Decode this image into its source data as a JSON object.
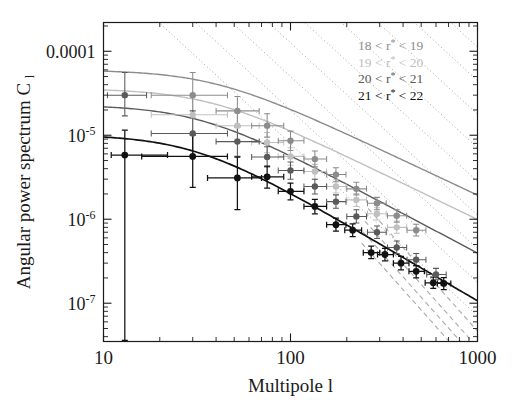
{
  "chart_data": {
    "type": "scatter",
    "title": "",
    "subtitle": "",
    "xlabel": "Multipole l",
    "ylabel": "Angular power spectrum C_l",
    "ylabel_base": "Angular power spectrum C",
    "ylabel_sub": "l",
    "xscale": "log",
    "yscale": "log",
    "xlim": [
      10,
      1000
    ],
    "ylim": [
      3.5e-08,
      0.00022
    ],
    "grid": false,
    "legend_position": "top-right",
    "xticks": [
      10,
      100,
      1000
    ],
    "xtick_labels": [
      "10",
      "100",
      "1000"
    ],
    "yticks": [
      0.0001,
      1e-05,
      1e-06,
      1e-07
    ],
    "ytick_labels": [
      "0.0001",
      "10⁻⁵",
      "10⁻⁶",
      "10⁻⁷"
    ],
    "ytick_label_parts": [
      {
        "mantissa": "0.0001",
        "exponent": ""
      },
      {
        "mantissa": "10",
        "exponent": "-5"
      },
      {
        "mantissa": "10",
        "exponent": "-6"
      },
      {
        "mantissa": "10",
        "exponent": "-7"
      }
    ],
    "annotations": [
      "dotted diagonal reference lines of constant slope",
      "dashed model extrapolations at high multipole"
    ],
    "series": [
      {
        "name": "18 < r* < 19",
        "legend_label_prefix": "18",
        "legend_label_mid": "r",
        "legend_label_suffix": "19",
        "color": "#8c8c8c",
        "marker": "circle",
        "linestyle": "solid",
        "points": [
          {
            "x": 30,
            "y": 3e-05,
            "ylo": 1.6e-05,
            "yhi": 5.6e-05,
            "xlo": 18,
            "xhi": 46
          },
          {
            "x": 52,
            "y": 1.95e-05,
            "ylo": 1.3e-05,
            "yhi": 2.9e-05,
            "xlo": 40,
            "xhi": 68
          },
          {
            "x": 75,
            "y": 1.3e-05,
            "ylo": 9.5e-06,
            "yhi": 1.8e-05,
            "xlo": 62,
            "xhi": 92
          },
          {
            "x": 100,
            "y": 8.6e-06,
            "ylo": 6.6e-06,
            "yhi": 1.12e-05,
            "xlo": 86,
            "xhi": 118
          },
          {
            "x": 135,
            "y": 5.2e-06,
            "ylo": 4.2e-06,
            "yhi": 6.5e-06,
            "xlo": 118,
            "xhi": 156
          },
          {
            "x": 175,
            "y": 3.4e-06,
            "ylo": 2.8e-06,
            "yhi": 4.1e-06,
            "xlo": 156,
            "xhi": 198
          },
          {
            "x": 225,
            "y": 2.3e-06,
            "ylo": 1.95e-06,
            "yhi": 2.75e-06,
            "xlo": 200,
            "xhi": 255
          },
          {
            "x": 290,
            "y": 1.55e-06,
            "ylo": 1.3e-06,
            "yhi": 1.82e-06,
            "xlo": 258,
            "xhi": 325
          },
          {
            "x": 370,
            "y": 1.1e-06,
            "ylo": 9.2e-07,
            "yhi": 1.3e-06,
            "xlo": 330,
            "xhi": 418
          },
          {
            "x": 470,
            "y": 7.4e-07,
            "ylo": 6.3e-07,
            "yhi": 8.7e-07,
            "xlo": 420,
            "xhi": 530
          }
        ],
        "curve": {
          "amp": 6e-05,
          "l0": 38,
          "index": 1.05
        }
      },
      {
        "name": "19 < r* < 20",
        "legend_label_prefix": "19",
        "legend_label_mid": "r",
        "legend_label_suffix": "20",
        "color": "#c0c0c0",
        "marker": "circle",
        "linestyle": "solid",
        "points": [
          {
            "x": 30,
            "y": 1.75e-05,
            "ylo": 1.05e-05,
            "yhi": 2.9e-05,
            "xlo": 18,
            "xhi": 46
          },
          {
            "x": 52,
            "y": 1.3e-05,
            "ylo": 9e-06,
            "yhi": 1.85e-05,
            "xlo": 40,
            "xhi": 68
          },
          {
            "x": 75,
            "y": 8.2e-06,
            "ylo": 6.2e-06,
            "yhi": 1.08e-05,
            "xlo": 62,
            "xhi": 92
          },
          {
            "x": 100,
            "y": 5.6e-06,
            "ylo": 4.4e-06,
            "yhi": 7.1e-06,
            "xlo": 86,
            "xhi": 118
          },
          {
            "x": 135,
            "y": 3.7e-06,
            "ylo": 3e-06,
            "yhi": 4.5e-06,
            "xlo": 118,
            "xhi": 156
          },
          {
            "x": 175,
            "y": 2.45e-06,
            "ylo": 2.05e-06,
            "yhi": 2.95e-06,
            "xlo": 156,
            "xhi": 198
          },
          {
            "x": 225,
            "y": 1.7e-06,
            "ylo": 1.42e-06,
            "yhi": 2.02e-06,
            "xlo": 200,
            "xhi": 255
          },
          {
            "x": 290,
            "y": 1.16e-06,
            "ylo": 9.8e-07,
            "yhi": 1.37e-06,
            "xlo": 258,
            "xhi": 325
          },
          {
            "x": 370,
            "y": 8e-07,
            "ylo": 6.8e-07,
            "yhi": 9.5e-07,
            "xlo": 330,
            "xhi": 418
          }
        ],
        "curve": {
          "amp": 3.6e-05,
          "l0": 36,
          "index": 1.08
        }
      },
      {
        "name": "20 < r* < 21",
        "legend_label_prefix": "20",
        "legend_label_mid": "r",
        "legend_label_suffix": "21",
        "color": "#5a5a5a",
        "marker": "circle",
        "linestyle": "solid",
        "points": [
          {
            "x": 13,
            "y": 3e-05,
            "ylo": 1.7e-05,
            "yhi": 5.6e-05,
            "xlo": 10.5,
            "xhi": 17
          },
          {
            "x": 30,
            "y": 1.05e-05,
            "ylo": 5.6e-06,
            "yhi": 1.95e-05,
            "xlo": 18,
            "xhi": 46
          },
          {
            "x": 52,
            "y": 8.4e-06,
            "ylo": 5.6e-06,
            "yhi": 1.25e-05,
            "xlo": 40,
            "xhi": 68
          },
          {
            "x": 75,
            "y": 5.5e-06,
            "ylo": 4.2e-06,
            "yhi": 7.3e-06,
            "xlo": 62,
            "xhi": 92
          },
          {
            "x": 100,
            "y": 3.8e-06,
            "ylo": 3e-06,
            "yhi": 4.8e-06,
            "xlo": 86,
            "xhi": 118
          },
          {
            "x": 135,
            "y": 2.45e-06,
            "ylo": 2e-06,
            "yhi": 3e-06,
            "xlo": 118,
            "xhi": 156
          },
          {
            "x": 175,
            "y": 1.62e-06,
            "ylo": 1.35e-06,
            "yhi": 1.95e-06,
            "xlo": 156,
            "xhi": 198
          },
          {
            "x": 225,
            "y": 1.08e-06,
            "ylo": 9e-07,
            "yhi": 1.3e-06,
            "xlo": 200,
            "xhi": 255
          },
          {
            "x": 290,
            "y": 7e-07,
            "ylo": 5.9e-07,
            "yhi": 8.3e-07,
            "xlo": 258,
            "xhi": 325
          },
          {
            "x": 370,
            "y": 4.6e-07,
            "ylo": 3.9e-07,
            "yhi": 5.5e-07,
            "xlo": 330,
            "xhi": 418
          },
          {
            "x": 470,
            "y": 3.3e-07,
            "ylo": 2.8e-07,
            "yhi": 3.9e-07,
            "xlo": 420,
            "xhi": 530
          },
          {
            "x": 600,
            "y": 2.2e-07,
            "ylo": 1.9e-07,
            "yhi": 2.6e-07,
            "xlo": 535,
            "xhi": 680
          }
        ],
        "curve": {
          "amp": 2.3e-05,
          "l0": 32,
          "index": 1.18
        }
      },
      {
        "name": "21 < r* < 22",
        "legend_label_prefix": "21",
        "legend_label_mid": "r",
        "legend_label_suffix": "22",
        "color": "#111111",
        "marker": "circle",
        "linestyle": "solid",
        "points": [
          {
            "x": 13,
            "y": 5.8e-06,
            "ylo": 3.6e-08,
            "yhi": 1.15e-05,
            "xlo": 11,
            "xhi": 22
          },
          {
            "x": 30,
            "y": 5.6e-06,
            "ylo": 2.4e-06,
            "yhi": 1e-05,
            "xlo": 16,
            "xhi": 46
          },
          {
            "x": 52,
            "y": 3.1e-06,
            "ylo": 1.3e-06,
            "yhi": 5.5e-06,
            "xlo": 36,
            "xhi": 70
          },
          {
            "x": 75,
            "y": 3.2e-06,
            "ylo": 2.35e-06,
            "yhi": 4.3e-06,
            "xlo": 62,
            "xhi": 92
          },
          {
            "x": 100,
            "y": 2.15e-06,
            "ylo": 1.7e-06,
            "yhi": 2.7e-06,
            "xlo": 86,
            "xhi": 118
          },
          {
            "x": 135,
            "y": 1.42e-06,
            "ylo": 1.16e-06,
            "yhi": 1.72e-06,
            "xlo": 118,
            "xhi": 156
          },
          {
            "x": 175,
            "y": 8.6e-07,
            "ylo": 7.2e-07,
            "yhi": 1.03e-06,
            "xlo": 156,
            "xhi": 198
          },
          {
            "x": 215,
            "y": 7.4e-07,
            "ylo": 6.2e-07,
            "yhi": 8.8e-07,
            "xlo": 195,
            "xhi": 240
          },
          {
            "x": 270,
            "y": 4e-07,
            "ylo": 3.4e-07,
            "yhi": 4.8e-07,
            "xlo": 245,
            "xhi": 300
          },
          {
            "x": 320,
            "y": 3.8e-07,
            "ylo": 3.2e-07,
            "yhi": 4.5e-07,
            "xlo": 292,
            "xhi": 355
          },
          {
            "x": 390,
            "y": 3e-07,
            "ylo": 2.5e-07,
            "yhi": 3.6e-07,
            "xlo": 355,
            "xhi": 430
          },
          {
            "x": 470,
            "y": 2.4e-07,
            "ylo": 2e-07,
            "yhi": 2.8e-07,
            "xlo": 430,
            "xhi": 520
          },
          {
            "x": 580,
            "y": 1.75e-07,
            "ylo": 1.5e-07,
            "yhi": 2.05e-07,
            "xlo": 525,
            "xhi": 640
          },
          {
            "x": 660,
            "y": 1.72e-07,
            "ylo": 1.45e-07,
            "yhi": 2.02e-07,
            "xlo": 610,
            "xhi": 720
          }
        ],
        "curve": {
          "amp": 1.02e-05,
          "l0": 30,
          "index": 1.3
        }
      }
    ],
    "dotted_reference_lines": {
      "slope": -2.05,
      "count": 11,
      "color": "#9a9a9a",
      "description": "parallel dotted power-law lines"
    },
    "dashed_extrapolations": {
      "count": 4,
      "color": "#aaaaaa",
      "description": "dashed high-l model branches"
    }
  },
  "legend": {
    "entries": [
      {
        "label": "18 < r* < 19",
        "color": "#8c8c8c"
      },
      {
        "label": "19 < r* < 20",
        "color": "#c0c0c0"
      },
      {
        "label": "20 < r* < 21",
        "color": "#5a5a5a"
      },
      {
        "label": "21 < r* < 22",
        "color": "#111111"
      }
    ]
  }
}
